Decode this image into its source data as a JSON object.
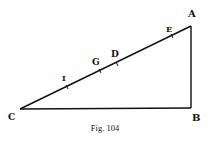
{
  "figure": {
    "caption": "Fig. 104",
    "line_color": "#111111",
    "background": "#ffffff"
  },
  "points": {
    "A": {
      "label": "A",
      "x": 191,
      "y": 26
    },
    "B": {
      "label": "B",
      "x": 191,
      "y": 108
    },
    "C": {
      "label": "C",
      "x": 20,
      "y": 109
    },
    "E": {
      "label": "E",
      "x": 172,
      "y": 36
    },
    "D": {
      "label": "D",
      "x": 117,
      "y": 64
    },
    "G": {
      "label": "G",
      "x": 100,
      "y": 71
    },
    "I": {
      "label": "I",
      "x": 67,
      "y": 87
    }
  },
  "segments": [
    {
      "from": "C",
      "to": "A"
    },
    {
      "from": "A",
      "to": "B"
    },
    {
      "from": "C",
      "to": "B"
    }
  ],
  "ticks_on_CA": [
    "I",
    "G",
    "D",
    "E"
  ]
}
